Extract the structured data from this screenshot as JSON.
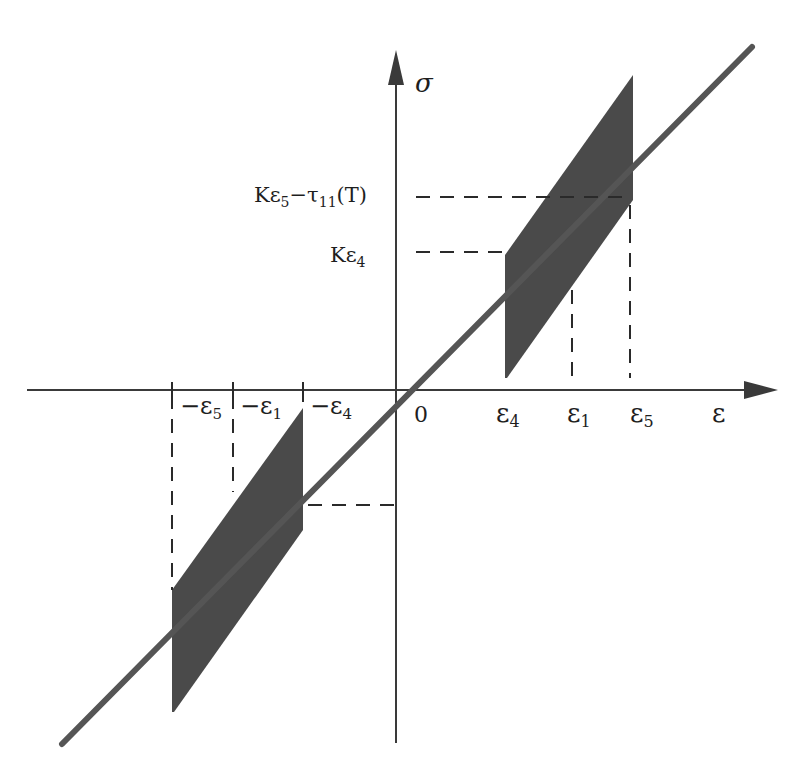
{
  "figure": {
    "type": "stress-strain hysteresis diagram",
    "axes": {
      "x_label": "ε",
      "y_label": "σ",
      "origin_label": "0"
    },
    "x_ticks": {
      "neg_eps5": "−ε",
      "neg_eps5_sub": "5",
      "neg_eps1": "−ε",
      "neg_eps1_sub": "1",
      "neg_eps4": "−ε",
      "neg_eps4_sub": "4",
      "eps4": "ε",
      "eps4_sub": "4",
      "eps1": "ε",
      "eps1_sub": "1",
      "eps5": "ε",
      "eps5_sub": "5"
    },
    "y_ticks": {
      "k_eps5_tau": {
        "prefix": "Kε",
        "sub1": "5",
        "mid": "−τ",
        "sub2": "11",
        "suffix": "(T)"
      },
      "k_eps4": {
        "prefix": "Kε",
        "sub1": "4"
      }
    },
    "colors": {
      "line": "#555555",
      "fill": "#4a4a4a",
      "axis": "#3a3a3a",
      "text": "#1e1e1e"
    },
    "elements": [
      "elastic line σ = Kε through origin",
      "upper shaded hysteresis band between ε4 and ε5",
      "lower shaded hysteresis band between −ε5 and −ε4",
      "dashed guide lines at ε1, ε5, −ε5, −ε1 and at Kε4, Kε5−τ11(T)"
    ]
  }
}
